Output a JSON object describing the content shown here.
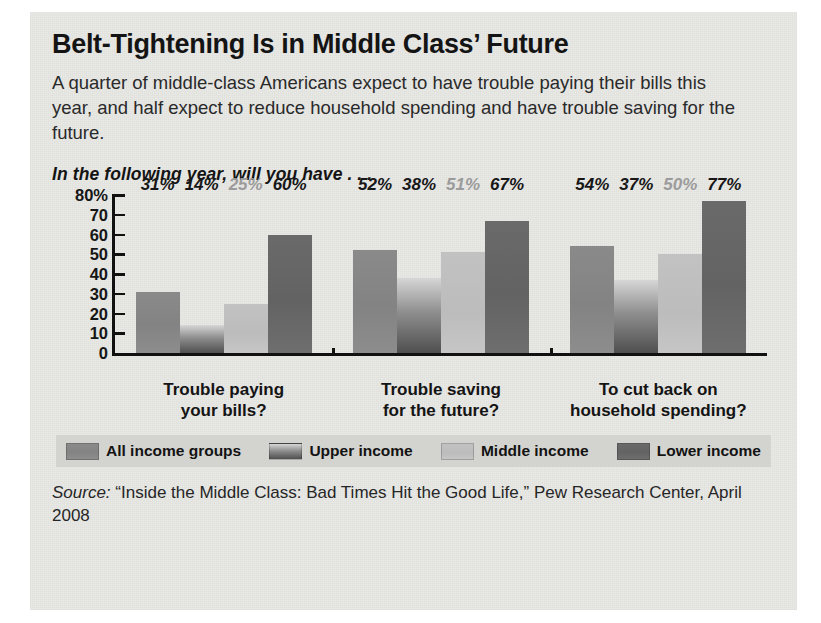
{
  "title": "Belt-Tightening Is in Middle Class’ Future",
  "deck": "A quarter of middle-class Americans expect to have trouble paying their bills this year, and half expect to reduce household spending and have trouble saving for the future.",
  "chart_question": "In the following year, will you have . . .",
  "source": {
    "label": "Source:",
    "text": "“Inside the Middle Class: Bad Times Hit the Good Life,” Pew Research Center, April 2008"
  },
  "legend": {
    "items": [
      {
        "label": "All income groups",
        "color": "#888888"
      },
      {
        "label": "Upper income",
        "color": "#8f8f8f"
      },
      {
        "label": "Middle income",
        "color": "#c2c2c2"
      },
      {
        "label": "Lower income",
        "color": "#666666"
      }
    ]
  },
  "chart_data": {
    "type": "bar",
    "title": "In the following year, will you have . . .",
    "xlabel": "",
    "ylabel": "",
    "ylim": [
      0,
      80
    ],
    "grid": false,
    "legend_position": "bottom",
    "ytick_labels": [
      "80%",
      "70",
      "60",
      "50",
      "40",
      "30",
      "20",
      "10",
      "0"
    ],
    "ytick_values": [
      80,
      70,
      60,
      50,
      40,
      30,
      20,
      10,
      0
    ],
    "categories": [
      "Trouble paying\nyour bills?",
      "Trouble saving\nfor the future?",
      "To cut back on\nhousehold spending?"
    ],
    "category_lines": [
      [
        "Trouble paying",
        "your bills?"
      ],
      [
        "Trouble saving",
        "for the future?"
      ],
      [
        "To cut back on",
        "household spending?"
      ]
    ],
    "series": [
      {
        "name": "All income groups",
        "values": [
          31,
          52,
          54
        ],
        "labels": [
          "31%",
          "52%",
          "54%"
        ],
        "color": "#888888",
        "label_color": "dark"
      },
      {
        "name": "Upper income",
        "values": [
          14,
          38,
          37
        ],
        "labels": [
          "14%",
          "38%",
          "37%"
        ],
        "color": "#8f8f8f",
        "label_color": "dark"
      },
      {
        "name": "Middle income",
        "values": [
          25,
          51,
          50
        ],
        "labels": [
          "25%",
          "51%",
          "50%"
        ],
        "color": "#c2c2c2",
        "label_color": "light"
      },
      {
        "name": "Lower income",
        "values": [
          60,
          67,
          77
        ],
        "labels": [
          "60%",
          "67%",
          "77%"
        ],
        "color": "#666666",
        "label_color": "dark"
      }
    ]
  }
}
